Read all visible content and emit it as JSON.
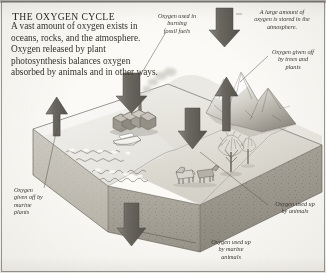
{
  "figure": {
    "title_first": "T",
    "title_rest": "HE OXYGEN CYCLE",
    "title_full": "THE OXYGEN CYCLE",
    "body": "A vast amount of oxygen exists in oceans, rocks, and the atmosphere. Oxygen released by plant photosynthesis balances oxygen absorbed by animals and in other ways.",
    "type": "3d-block-cutaway-diagram"
  },
  "captions": {
    "fossil_fuels": "Oxygen used in\nburning\nfossil fuels",
    "fossil_fuels_lines": [
      "Oxygen used in",
      "burning",
      "fossil fuels"
    ],
    "atmosphere": "A large amount of\noxygen is stored in the\natmosphere.",
    "atmosphere_lines": [
      "A large amount of",
      "oxygen is stored in the",
      "atmosphere."
    ],
    "trees": "Oxygen given off\nby trees and\nplants",
    "trees_lines": [
      "Oxygen given off",
      "by trees and",
      "plants"
    ],
    "animals": "Oxygen used up\nby animals",
    "animals_lines": [
      "Oxygen used up",
      "by animals"
    ],
    "marine_plants": "Oxygen\ngiven off by\nmarine\nplants",
    "marine_plants_lines": [
      "Oxygen",
      "given off by",
      "marine",
      "plants"
    ],
    "marine_animals": "Oxygen used up\nby marine\nanimals",
    "marine_animals_lines": [
      "Oxygen used up",
      "by marine",
      "animals"
    ]
  },
  "scene": {
    "elements": [
      "factory",
      "smokestack",
      "boat",
      "cattle",
      "trees",
      "mountains",
      "sea",
      "rock-strata"
    ],
    "arrow_down_count": 4,
    "arrow_up_count": 2
  },
  "colors": {
    "paper": "#fbfaf6",
    "ink": "#36322d",
    "arrow": "#6d6a64",
    "land_top": "#dedbd3",
    "rock": "#9a968d",
    "sea": "#e8e7e2",
    "frame": "#4a4742"
  }
}
